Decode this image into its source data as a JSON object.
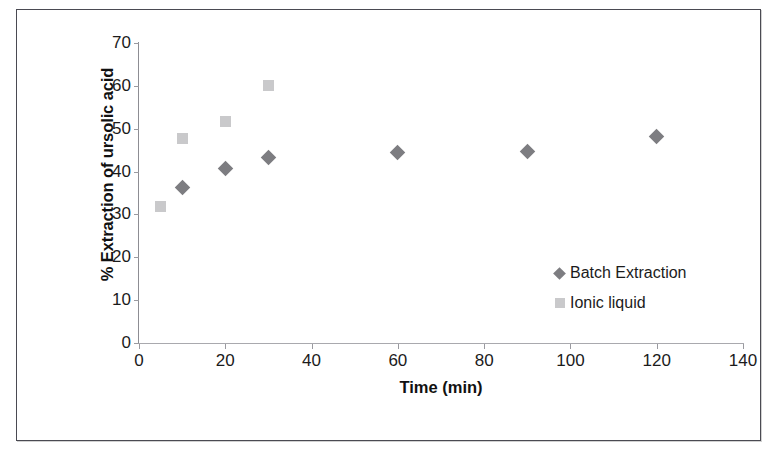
{
  "chart_data": {
    "type": "scatter",
    "title": "",
    "xlabel": "Time (min)",
    "ylabel": "% Extraction of ursolic acid",
    "xlim": [
      0,
      140
    ],
    "ylim": [
      0,
      70
    ],
    "xticks": [
      0,
      20,
      40,
      60,
      80,
      100,
      120,
      140
    ],
    "yticks": [
      0,
      10,
      20,
      30,
      40,
      50,
      60,
      70
    ],
    "grid": false,
    "legend_position": "inside-right",
    "series": [
      {
        "name": "Batch Extraction",
        "marker": "diamond",
        "color": "#7d7d81",
        "points": [
          {
            "x": 10,
            "y": 36.3
          },
          {
            "x": 20,
            "y": 40.8
          },
          {
            "x": 30,
            "y": 43.2
          },
          {
            "x": 60,
            "y": 44.5
          },
          {
            "x": 90,
            "y": 44.6
          },
          {
            "x": 120,
            "y": 48.2
          }
        ]
      },
      {
        "name": "Ionic liquid",
        "marker": "square",
        "color": "#c9c9cb",
        "points": [
          {
            "x": 5,
            "y": 31.8
          },
          {
            "x": 10,
            "y": 47.8
          },
          {
            "x": 20,
            "y": 51.7
          },
          {
            "x": 30,
            "y": 60.0
          }
        ]
      }
    ]
  },
  "legend": {
    "entries": [
      {
        "label": "Batch Extraction",
        "marker": "diamond"
      },
      {
        "label": "Ionic liquid",
        "marker": "square"
      }
    ]
  },
  "colors": {
    "batch_extraction": "#7d7d81",
    "ionic_liquid": "#c9c9cb",
    "axis": "#8d8d93",
    "text": "#1b1b1b",
    "frame": "#4a4a52"
  }
}
